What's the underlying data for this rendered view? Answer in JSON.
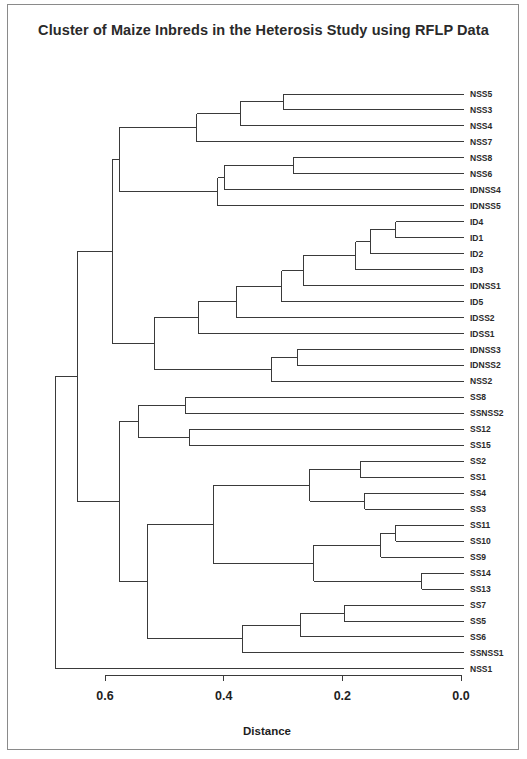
{
  "chart_data": {
    "type": "dendrogram",
    "title": "Cluster of Maize Inbreds in the Heterosis Study using RFLP Data",
    "xlabel": "Distance",
    "ylabel": "",
    "xlim": [
      0.6,
      0.0
    ],
    "x_ticks": [
      0.6,
      0.4,
      0.2,
      0.0
    ],
    "x_tick_labels": [
      "0.6",
      "0.4",
      "0.2",
      "0.0"
    ],
    "grid": false,
    "legend": null,
    "leaves": [
      "NSS5",
      "NSS3",
      "NSS4",
      "NSS7",
      "NSS8",
      "NSS6",
      "IDNSS4",
      "IDNSS5",
      "ID4",
      "ID1",
      "ID2",
      "ID3",
      "IDNSS1",
      "ID5",
      "IDSS2",
      "IDSS1",
      "IDNSS3",
      "IDNSS2",
      "NSS2",
      "SS8",
      "SSNSS2",
      "SS12",
      "SS15",
      "SS2",
      "SS1",
      "SS4",
      "SS3",
      "SS11",
      "SS10",
      "SS9",
      "SS14",
      "SS13",
      "SS7",
      "SS5",
      "SS6",
      "SSNSS1",
      "NSS1"
    ],
    "tree": {
      "d": 0.684,
      "children": [
        {
          "d": 0.647,
          "children": [
            {
              "d": 0.588,
              "children": [
                {
                  "d": 0.576,
                  "children": [
                    {
                      "d": 0.445,
                      "children": [
                        {
                          "d": 0.372,
                          "children": [
                            {
                              "d": 0.3,
                              "children": [
                                {
                                  "leaf": "NSS5"
                                },
                                {
                                  "leaf": "NSS3"
                                }
                              ]
                            },
                            {
                              "leaf": "NSS4"
                            }
                          ]
                        },
                        {
                          "leaf": "NSS7"
                        }
                      ]
                    },
                    {
                      "d": 0.41,
                      "children": [
                        {
                          "d": 0.399,
                          "children": [
                            {
                              "d": 0.283,
                              "children": [
                                {
                                  "leaf": "NSS8"
                                },
                                {
                                  "leaf": "NSS6"
                                }
                              ]
                            },
                            {
                              "leaf": "IDNSS4"
                            }
                          ]
                        },
                        {
                          "leaf": "IDNSS5"
                        }
                      ]
                    }
                  ]
                },
                {
                  "d": 0.517,
                  "children": [
                    {
                      "d": 0.443,
                      "children": [
                        {
                          "d": 0.378,
                          "children": [
                            {
                              "d": 0.302,
                              "children": [
                                {
                                  "d": 0.266,
                                  "children": [
                                    {
                                      "d": 0.177,
                                      "children": [
                                        {
                                          "d": 0.153,
                                          "children": [
                                            {
                                              "d": 0.11,
                                              "children": [
                                                {
                                                  "leaf": "ID4"
                                                },
                                                {
                                                  "leaf": "ID1"
                                                }
                                              ]
                                            },
                                            {
                                              "leaf": "ID2"
                                            }
                                          ]
                                        },
                                        {
                                          "leaf": "ID3"
                                        }
                                      ]
                                    },
                                    {
                                      "leaf": "IDNSS1"
                                    }
                                  ]
                                },
                                {
                                  "leaf": "ID5"
                                }
                              ]
                            },
                            {
                              "leaf": "IDSS2"
                            }
                          ]
                        },
                        {
                          "leaf": "IDSS1"
                        }
                      ]
                    },
                    {
                      "d": 0.32,
                      "children": [
                        {
                          "d": 0.276,
                          "children": [
                            {
                              "leaf": "IDNSS3"
                            },
                            {
                              "leaf": "IDNSS2"
                            }
                          ]
                        },
                        {
                          "leaf": "NSS2"
                        }
                      ]
                    }
                  ]
                }
              ]
            },
            {
              "d": 0.575,
              "children": [
                {
                  "d": 0.544,
                  "children": [
                    {
                      "d": 0.465,
                      "children": [
                        {
                          "leaf": "SS8"
                        },
                        {
                          "leaf": "SSNSS2"
                        }
                      ]
                    },
                    {
                      "d": 0.458,
                      "children": [
                        {
                          "leaf": "SS12"
                        },
                        {
                          "leaf": "SS15"
                        }
                      ]
                    }
                  ]
                },
                {
                  "d": 0.528,
                  "children": [
                    {
                      "d": 0.418,
                      "children": [
                        {
                          "d": 0.255,
                          "children": [
                            {
                              "d": 0.17,
                              "children": [
                                {
                                  "leaf": "SS2"
                                },
                                {
                                  "leaf": "SS1"
                                }
                              ]
                            },
                            {
                              "d": 0.162,
                              "children": [
                                {
                                  "leaf": "SS4"
                                },
                                {
                                  "leaf": "SS3"
                                }
                              ]
                            }
                          ]
                        },
                        {
                          "d": 0.248,
                          "children": [
                            {
                              "d": 0.135,
                              "children": [
                                {
                                  "d": 0.11,
                                  "children": [
                                    {
                                      "leaf": "SS11"
                                    },
                                    {
                                      "leaf": "SS10"
                                    }
                                  ]
                                },
                                {
                                  "leaf": "SS9"
                                }
                              ]
                            },
                            {
                              "d": 0.066,
                              "children": [
                                {
                                  "leaf": "SS14"
                                },
                                {
                                  "leaf": "SS13"
                                }
                              ]
                            }
                          ]
                        }
                      ]
                    },
                    {
                      "d": 0.369,
                      "children": [
                        {
                          "d": 0.271,
                          "children": [
                            {
                              "d": 0.197,
                              "children": [
                                {
                                  "leaf": "SS7"
                                },
                                {
                                  "leaf": "SS5"
                                }
                              ]
                            },
                            {
                              "leaf": "SS6"
                            }
                          ]
                        },
                        {
                          "leaf": "SSNSS1"
                        }
                      ]
                    }
                  ]
                }
              ]
            }
          ]
        },
        {
          "leaf": "NSS1"
        }
      ]
    }
  },
  "layout": {
    "x_at_zero": 461,
    "px_per_unit": 593.3,
    "leaf_line_end": 464,
    "label_x": 470,
    "first_row_y": 94,
    "row_step": 15.97,
    "axis_y": 675,
    "tick_len": 6,
    "tick_label_y": 700,
    "axis_title_y": 735,
    "line_color": "#3a3a3a"
  }
}
